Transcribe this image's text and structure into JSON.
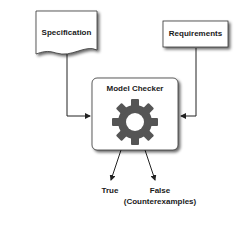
{
  "nodes": {
    "specification": {
      "label": "Specification"
    },
    "requirements": {
      "label": "Requirements"
    },
    "model_checker": {
      "label": "Model Checker",
      "icon": "gear-icon"
    }
  },
  "outputs": {
    "true_label": "True",
    "false_label": "False",
    "false_sublabel": "(Counterexamples)"
  },
  "colors": {
    "box_fill": "#ffffff",
    "box_stroke": "#333333",
    "gear_fill": "#555555",
    "line": "#222222"
  }
}
